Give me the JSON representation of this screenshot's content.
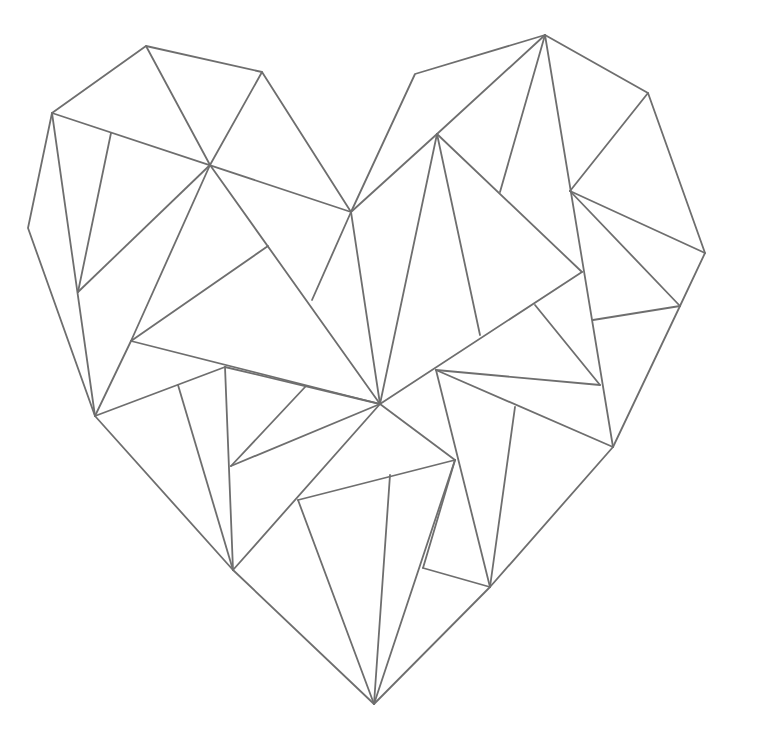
{
  "artwork": {
    "subject": "geometric-heart",
    "stroke_color": "#6e6e6e",
    "background_color": "#ffffff",
    "stroke_width": 1.8,
    "outline": [
      [
        146,
        46
      ],
      [
        262,
        72
      ],
      [
        351,
        212
      ],
      [
        415,
        74
      ],
      [
        545,
        35
      ],
      [
        648,
        93
      ],
      [
        705,
        253
      ],
      [
        680,
        306
      ],
      [
        613,
        447
      ],
      [
        490,
        587
      ],
      [
        374,
        704
      ],
      [
        233,
        570
      ],
      [
        95,
        416
      ],
      [
        28,
        228
      ],
      [
        52,
        113
      ]
    ],
    "segments": [
      [
        [
          146,
          46
        ],
        [
          210,
          165
        ]
      ],
      [
        [
          262,
          72
        ],
        [
          210,
          165
        ]
      ],
      [
        [
          52,
          113
        ],
        [
          351,
          212
        ]
      ],
      [
        [
          52,
          113
        ],
        [
          95,
          416
        ]
      ],
      [
        [
          111,
          133
        ],
        [
          78,
          292
        ]
      ],
      [
        [
          210,
          165
        ],
        [
          78,
          292
        ]
      ],
      [
        [
          210,
          165
        ],
        [
          131,
          341
        ]
      ],
      [
        [
          210,
          165
        ],
        [
          380,
          404
        ]
      ],
      [
        [
          268,
          246
        ],
        [
          131,
          341
        ]
      ],
      [
        [
          131,
          341
        ],
        [
          380,
          404
        ]
      ],
      [
        [
          351,
          212
        ],
        [
          312,
          300
        ]
      ],
      [
        [
          351,
          212
        ],
        [
          380,
          404
        ]
      ],
      [
        [
          351,
          212
        ],
        [
          437,
          134
        ]
      ],
      [
        [
          545,
          35
        ],
        [
          437,
          134
        ]
      ],
      [
        [
          545,
          35
        ],
        [
          500,
          192
        ]
      ],
      [
        [
          545,
          35
        ],
        [
          613,
          447
        ]
      ],
      [
        [
          648,
          93
        ],
        [
          570,
          191
        ]
      ],
      [
        [
          570,
          191
        ],
        [
          705,
          253
        ]
      ],
      [
        [
          570,
          191
        ],
        [
          680,
          306
        ]
      ],
      [
        [
          593,
          320
        ],
        [
          680,
          306
        ]
      ],
      [
        [
          437,
          134
        ],
        [
          380,
          404
        ]
      ],
      [
        [
          437,
          134
        ],
        [
          480,
          335
        ]
      ],
      [
        [
          437,
          134
        ],
        [
          582,
          272
        ]
      ],
      [
        [
          582,
          272
        ],
        [
          380,
          404
        ]
      ],
      [
        [
          535,
          305
        ],
        [
          600,
          385
        ]
      ],
      [
        [
          436,
          370
        ],
        [
          600,
          385
        ]
      ],
      [
        [
          436,
          370
        ],
        [
          613,
          447
        ]
      ],
      [
        [
          436,
          370
        ],
        [
          490,
          587
        ]
      ],
      [
        [
          515,
          407
        ],
        [
          490,
          587
        ]
      ],
      [
        [
          95,
          416
        ],
        [
          225,
          367
        ]
      ],
      [
        [
          178,
          385
        ],
        [
          233,
          570
        ]
      ],
      [
        [
          225,
          367
        ],
        [
          233,
          570
        ]
      ],
      [
        [
          233,
          570
        ],
        [
          380,
          404
        ]
      ],
      [
        [
          231,
          466
        ],
        [
          306,
          386
        ]
      ],
      [
        [
          231,
          466
        ],
        [
          380,
          404
        ]
      ],
      [
        [
          380,
          404
        ],
        [
          455,
          460
        ]
      ],
      [
        [
          298,
          500
        ],
        [
          455,
          460
        ]
      ],
      [
        [
          298,
          500
        ],
        [
          374,
          704
        ]
      ],
      [
        [
          390,
          475
        ],
        [
          374,
          704
        ]
      ],
      [
        [
          455,
          460
        ],
        [
          374,
          704
        ]
      ],
      [
        [
          455,
          460
        ],
        [
          423,
          568
        ]
      ],
      [
        [
          423,
          568
        ],
        [
          490,
          587
        ]
      ],
      [
        [
          95,
          416
        ],
        [
          131,
          341
        ]
      ],
      [
        [
          225,
          367
        ],
        [
          380,
          404
        ]
      ]
    ]
  }
}
